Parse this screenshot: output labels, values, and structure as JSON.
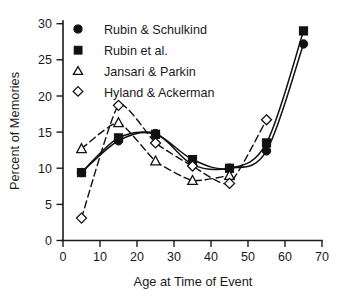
{
  "chart_data": {
    "type": "line",
    "title": "",
    "xlabel": "Age at Time of Event",
    "ylabel": "Percent of Memories",
    "xlim": [
      0,
      70
    ],
    "ylim": [
      0,
      30
    ],
    "xticks": [
      0,
      10,
      20,
      30,
      40,
      50,
      60,
      70
    ],
    "yticks": [
      0,
      5,
      10,
      15,
      20,
      25,
      30
    ],
    "grid": false,
    "legend_position": "top-left",
    "x": [
      5,
      15,
      25,
      35,
      45,
      55,
      65
    ],
    "series": [
      {
        "name": "Rubin & Schulkind",
        "marker": "filled-circle",
        "line": "solid",
        "x": [
          5,
          15,
          25,
          35,
          45,
          55,
          65
        ],
        "values": [
          9.4,
          13.8,
          14.8,
          10.5,
          10.0,
          12.4,
          27.2
        ]
      },
      {
        "name": "Rubin et al.",
        "marker": "filled-square",
        "line": "solid",
        "x": [
          5,
          15,
          25,
          35,
          45,
          55,
          65
        ],
        "values": [
          9.4,
          14.2,
          14.7,
          11.2,
          10.0,
          13.5,
          29.0
        ]
      },
      {
        "name": "Jansari & Parkin",
        "marker": "open-triangle",
        "line": "dashed",
        "x": [
          5,
          15,
          25,
          35,
          45
        ],
        "values": [
          12.7,
          16.3,
          11.0,
          8.3,
          9.0
        ]
      },
      {
        "name": "Hyland & Ackerman",
        "marker": "open-diamond",
        "line": "dashed",
        "x": [
          5,
          15,
          25,
          35,
          45,
          55
        ],
        "values": [
          3.1,
          18.7,
          13.5,
          10.3,
          7.9,
          16.7
        ]
      }
    ]
  },
  "axes": {
    "ylabel": "Percent of Memories",
    "xlabel": "Age at Time of Event",
    "ytick_labels": [
      "0",
      "5",
      "10",
      "15",
      "20",
      "25",
      "30"
    ],
    "xtick_labels": [
      "0",
      "10",
      "20",
      "30",
      "40",
      "50",
      "60",
      "70"
    ]
  },
  "legend": {
    "items": [
      {
        "label": "Rubin & Schulkind",
        "marker": "filled-circle"
      },
      {
        "label": "Rubin et al.",
        "marker": "filled-square"
      },
      {
        "label": "Jansari & Parkin",
        "marker": "open-triangle"
      },
      {
        "label": "Hyland & Ackerman",
        "marker": "open-diamond"
      }
    ]
  },
  "colors": {
    "ink": "#111111",
    "background": "#ffffff"
  }
}
